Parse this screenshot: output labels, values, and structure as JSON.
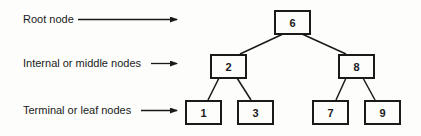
{
  "legend": {
    "root": "Root node",
    "internal": "Internal or middle nodes",
    "leaf": "Terminal or leaf nodes"
  },
  "tree": {
    "root": "6",
    "internal": [
      "2",
      "8"
    ],
    "leaves": [
      "1",
      "3",
      "7",
      "9"
    ]
  },
  "edges": [
    [
      "6",
      "2"
    ],
    [
      "6",
      "8"
    ],
    [
      "2",
      "1"
    ],
    [
      "2",
      "3"
    ],
    [
      "8",
      "7"
    ],
    [
      "8",
      "9"
    ]
  ],
  "colors": {
    "ink": "#1a1a1a",
    "background": "#fdfdfb"
  }
}
